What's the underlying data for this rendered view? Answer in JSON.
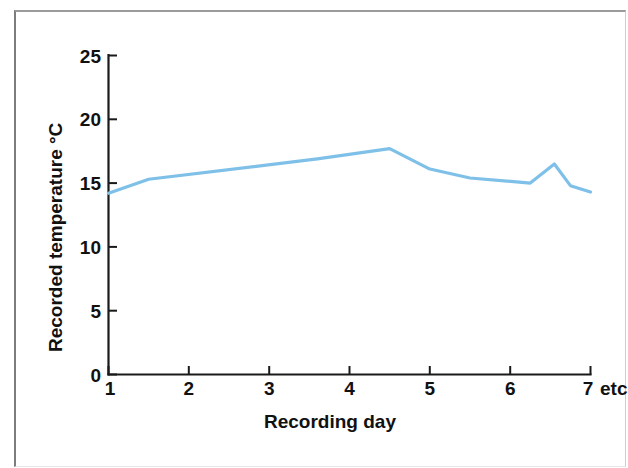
{
  "figure": {
    "background_color": "#ffffff",
    "frame_color": "#8d8d8d",
    "width": 628,
    "height": 468
  },
  "chart_data": {
    "type": "line",
    "title": "",
    "subtitle": "",
    "xlabel": "Recording day",
    "ylabel": "Recorded temperature °C",
    "xlim": [
      1,
      7
    ],
    "ylim": [
      0,
      25
    ],
    "xticks": [
      1,
      2,
      3,
      4,
      5,
      6,
      7
    ],
    "xticklabels": [
      "1",
      "2",
      "3",
      "4",
      "5",
      "6",
      "7"
    ],
    "yticks": [
      0,
      5,
      10,
      15,
      20,
      25
    ],
    "yticklabels": [
      "0",
      "5",
      "10",
      "15",
      "20",
      "25"
    ],
    "x_axis_suffix": "etc",
    "grid": false,
    "legend": false,
    "legend_position": "none",
    "line_color": "#7ec0e8",
    "series": [
      {
        "name": "Recorded temperature",
        "color": "#7ec0e8",
        "x": [
          1.0,
          1.5,
          3.6,
          4.5,
          5.0,
          5.5,
          6.25,
          6.55,
          6.75,
          7.0
        ],
        "y": [
          14.2,
          15.3,
          16.9,
          17.7,
          16.1,
          15.4,
          15.0,
          16.5,
          14.8,
          14.3
        ]
      }
    ],
    "annotations": []
  },
  "labels": {
    "y_axis_title": "Recorded temperature °C",
    "x_axis_title": "Recording day",
    "etc": "etc",
    "y_tick_0": "0",
    "y_tick_5": "5",
    "y_tick_10": "10",
    "y_tick_15": "15",
    "y_tick_20": "20",
    "y_tick_25": "25",
    "x_tick_1": "1",
    "x_tick_2": "2",
    "x_tick_3": "3",
    "x_tick_4": "4",
    "x_tick_5": "5",
    "x_tick_6": "6",
    "x_tick_7": "7"
  }
}
